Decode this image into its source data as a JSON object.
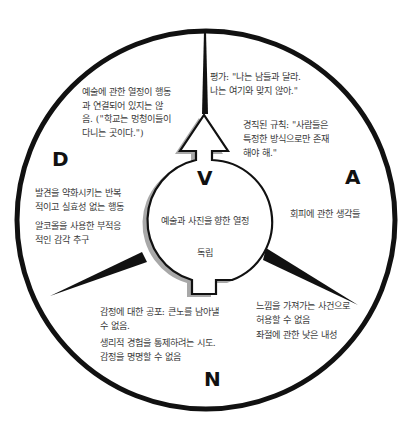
{
  "diagram": {
    "type": "circular-quadrant",
    "colors": {
      "outline": "#111111",
      "shadow": "#9a9a9a",
      "background": "#ffffff",
      "text": "#3a3a3a"
    },
    "quadrants": {
      "V": {
        "letter": "V"
      },
      "A": {
        "letter": "A"
      },
      "N": {
        "letter": "N"
      },
      "D": {
        "letter": "D"
      }
    },
    "center": {
      "line1": "예술과 사진을 향한 열정",
      "line2": "독립"
    },
    "top_left": {
      "text": "예술에 관한 열정이 행동\n과 연결되어 있지는 않\n음. (\"학교는 멍청이들이\n다니는 곳이다.\")"
    },
    "top_right": {
      "evaluation": "평가: \"나는 남들과 달라.\n나는 여기와 맞지 않아.\"",
      "rule": "경직된 규칙: \"사람들은\n특정한 방식으로만 존재\n해야 해.\""
    },
    "right": {
      "text": "회피에 관한 생각들"
    },
    "left": {
      "item1": "발견을 약화시키는 반복\n적이고 실효성 없는 행동",
      "item2": "알코올을 사용한 부적응\n적인 감각 추구"
    },
    "bottom_left": {
      "item1": "감정에 대한 공포: 큰노를 남아낼\n수 없음.",
      "item2": "생리적 경험을 통제하려는 시도.\n감정을 명명할 수 없음"
    },
    "bottom_right": {
      "item1": "느낌을 가져가는 사건으로\n허용할 수 없음",
      "item2": "좌절에 관한 낮은 내성"
    }
  }
}
